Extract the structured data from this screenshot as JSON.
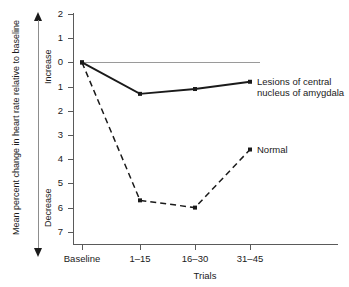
{
  "chart_data": {
    "type": "line",
    "title": "",
    "xlabel": "Trials",
    "ylabel": "Mean percent change in heart rate relative to baseline",
    "categories": [
      "Baseline",
      "1–15",
      "16–30",
      "31–45"
    ],
    "ytick_labels": [
      "2",
      "1",
      "0",
      "1",
      "2",
      "3",
      "4",
      "5",
      "6",
      "7"
    ],
    "ytick_values": [
      2,
      1,
      0,
      -1,
      -2,
      -3,
      -4,
      -5,
      -6,
      -7
    ],
    "ylim": [
      -7.6,
      2.4
    ],
    "grid": false,
    "legend_position": "inline-right-labels",
    "axis_direction_labels": {
      "up": "Increase",
      "down": "Decrease"
    },
    "zero_reference_line": true,
    "series": [
      {
        "name": "Lesions of central nucleus of amygdala",
        "style": "solid",
        "color": "#1a1a1a",
        "marker": "square",
        "values": [
          0,
          -1.3,
          -1.1,
          -0.8
        ]
      },
      {
        "name": "Normal",
        "style": "dashed",
        "color": "#1a1a1a",
        "marker": "square",
        "values": [
          0,
          -5.7,
          -6.0,
          -3.6
        ]
      }
    ],
    "annotations": [
      {
        "name": "lesions-label",
        "text": "Lesions of central\nnucleus of\namygdala",
        "attached_to_point": {
          "series": "Lesions of central nucleus of amygdala",
          "category": "31–45"
        }
      },
      {
        "name": "normal-label",
        "text": "Normal",
        "attached_to_point": {
          "series": "Normal",
          "category": "31–45"
        }
      }
    ]
  }
}
